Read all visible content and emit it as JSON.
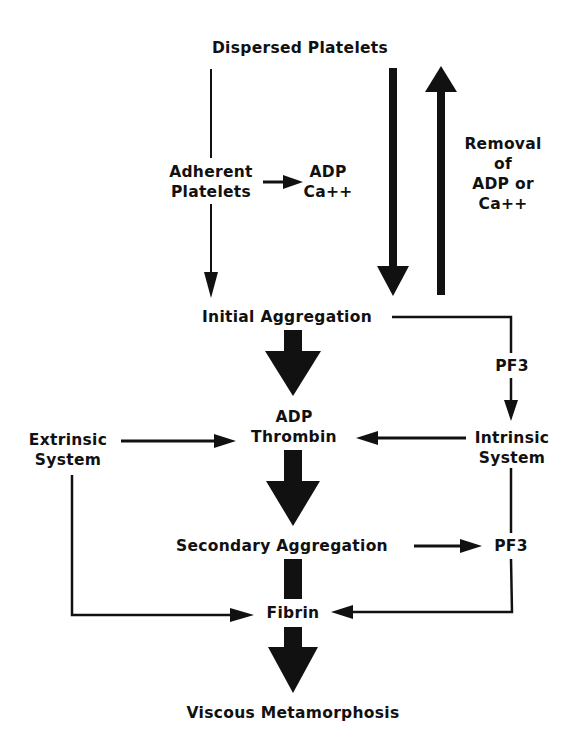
{
  "diagram": {
    "type": "flowchart",
    "colors": {
      "ink": "#111111",
      "background": "#ffffff"
    },
    "nodes": {
      "dispersed_platelets": "Dispersed Platelets",
      "adherent_platelets_1": "Adherent",
      "adherent_platelets_2": "Platelets",
      "adp_ca_1": "ADP",
      "adp_ca_2": "Ca++",
      "removal_1": "Removal",
      "removal_2": "of",
      "removal_3": "ADP or",
      "removal_4": "Ca++",
      "initial_aggregation": "Initial Aggregation",
      "pf3_top": "PF3",
      "adp_thrombin_1": "ADP",
      "adp_thrombin_2": "Thrombin",
      "extrinsic_1": "Extrinsic",
      "extrinsic_2": "System",
      "intrinsic_1": "Intrinsic",
      "intrinsic_2": "System",
      "secondary_aggregation": "Secondary Aggregation",
      "pf3_bottom": "PF3",
      "fibrin": "Fibrin",
      "viscous_metamorphosis": "Viscous Metamorphosis"
    },
    "edges": [
      {
        "from": "Dispersed Platelets",
        "to": "Initial Aggregation",
        "style": "thin",
        "via": "Adherent Platelets"
      },
      {
        "from": "Adherent Platelets",
        "to": "ADP Ca++",
        "style": "thin"
      },
      {
        "from": "Dispersed Platelets",
        "to": "Initial Aggregation",
        "style": "bold"
      },
      {
        "from": "Initial Aggregation",
        "to": "Dispersed Platelets",
        "style": "bold",
        "label": "Removal of ADP or Ca++"
      },
      {
        "from": "Initial Aggregation",
        "to": "ADP Thrombin",
        "style": "block"
      },
      {
        "from": "Initial Aggregation",
        "to": "Intrinsic System",
        "style": "thin",
        "label": "PF3"
      },
      {
        "from": "Extrinsic System",
        "to": "ADP Thrombin",
        "style": "thin"
      },
      {
        "from": "Intrinsic System",
        "to": "ADP Thrombin",
        "style": "thin"
      },
      {
        "from": "ADP Thrombin",
        "to": "Secondary Aggregation",
        "style": "block"
      },
      {
        "from": "Secondary Aggregation",
        "to": "PF3",
        "style": "thin"
      },
      {
        "from": "Secondary Aggregation",
        "to": "Fibrin",
        "style": "block"
      },
      {
        "from": "Extrinsic System",
        "to": "Fibrin",
        "style": "thin"
      },
      {
        "from": "Intrinsic System",
        "to": "Fibrin",
        "style": "thin",
        "via": "PF3"
      },
      {
        "from": "Fibrin",
        "to": "Viscous Metamorphosis",
        "style": "block"
      }
    ]
  }
}
